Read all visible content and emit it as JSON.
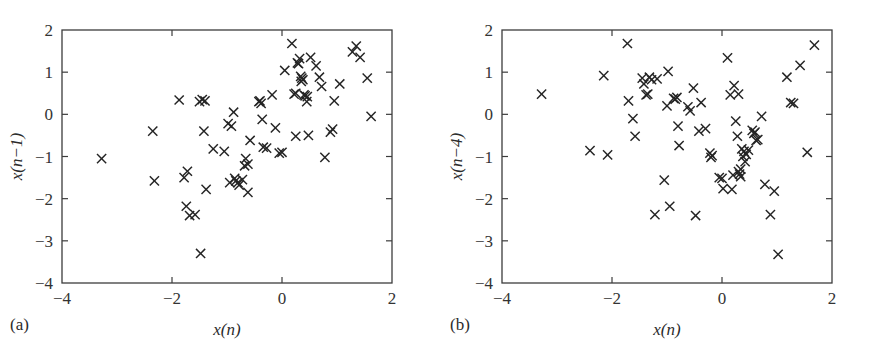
{
  "figure": {
    "background_color": "#ffffff",
    "marker_color": "#242424",
    "axis_color": "#3c3c3c",
    "marker_symbol": "x",
    "panel_count": 2
  },
  "panels": [
    {
      "caption": "(a)",
      "xlabel": "x(n)",
      "ylabel": "x(n−1)"
    },
    {
      "caption": "(b)",
      "xlabel": "x(n)",
      "ylabel": "x(n−4)"
    }
  ],
  "chart_data": [
    {
      "type": "scatter",
      "title": "",
      "panel": "(a)",
      "xlabel": "x(n)",
      "ylabel": "x(n-1)",
      "xlim": [
        -4,
        2
      ],
      "ylim": [
        -4,
        2
      ],
      "xticks": [
        -4,
        -2,
        0,
        2
      ],
      "yticks": [
        -4,
        -3,
        -2,
        -1,
        0,
        1,
        2
      ],
      "xtick_labels": [
        "-4",
        "-2",
        "0",
        "2"
      ],
      "ytick_labels": [
        "-4",
        "-3",
        "-2",
        "-1",
        "0",
        "1",
        "2"
      ],
      "grid": false,
      "legend": false,
      "marker": "x",
      "n_points": 72,
      "points": [
        [
          -3.28,
          -1.05
        ],
        [
          -2.35,
          -0.4
        ],
        [
          -2.32,
          -1.58
        ],
        [
          -1.87,
          0.34
        ],
        [
          -1.78,
          -1.5
        ],
        [
          -1.72,
          -1.35
        ],
        [
          -1.74,
          -2.18
        ],
        [
          -1.68,
          -2.4
        ],
        [
          -1.58,
          -2.38
        ],
        [
          -1.48,
          -3.3
        ],
        [
          -1.45,
          0.35
        ],
        [
          -1.4,
          0.32
        ],
        [
          -1.42,
          -0.4
        ],
        [
          -1.38,
          -1.78
        ],
        [
          -1.25,
          -0.82
        ],
        [
          -1.05,
          -0.88
        ],
        [
          -0.98,
          -0.22
        ],
        [
          -0.92,
          -0.28
        ],
        [
          -0.88,
          0.05
        ],
        [
          -0.86,
          -1.52
        ],
        [
          -0.84,
          -1.58
        ],
        [
          -0.8,
          -1.62
        ],
        [
          -0.78,
          -1.68
        ],
        [
          -0.72,
          -1.55
        ],
        [
          -0.68,
          -1.22
        ],
        [
          -0.66,
          -1.05
        ],
        [
          -0.62,
          -1.85
        ],
        [
          -0.58,
          -0.62
        ],
        [
          -0.42,
          0.3
        ],
        [
          -0.38,
          0.26
        ],
        [
          -0.36,
          -0.12
        ],
        [
          -0.34,
          -0.78
        ],
        [
          -0.28,
          -0.8
        ],
        [
          -0.18,
          0.46
        ],
        [
          -0.12,
          -0.32
        ],
        [
          -0.05,
          -0.92
        ],
        [
          0.0,
          -0.9
        ],
        [
          0.05,
          1.04
        ],
        [
          0.18,
          1.68
        ],
        [
          0.22,
          0.48
        ],
        [
          0.25,
          -0.52
        ],
        [
          0.28,
          1.22
        ],
        [
          0.32,
          1.32
        ],
        [
          0.35,
          0.78
        ],
        [
          0.38,
          0.82
        ],
        [
          0.4,
          0.46
        ],
        [
          0.42,
          0.44
        ],
        [
          0.45,
          0.3
        ],
        [
          0.48,
          -0.5
        ],
        [
          0.52,
          1.35
        ],
        [
          0.62,
          1.15
        ],
        [
          0.68,
          0.88
        ],
        [
          0.72,
          0.66
        ],
        [
          0.78,
          -1.02
        ],
        [
          0.88,
          -0.42
        ],
        [
          0.92,
          -0.35
        ],
        [
          0.95,
          0.32
        ],
        [
          1.05,
          0.72
        ],
        [
          1.28,
          1.48
        ],
        [
          1.35,
          1.62
        ],
        [
          1.42,
          1.35
        ],
        [
          1.55,
          0.86
        ],
        [
          1.62,
          -0.05
        ],
        [
          -0.95,
          -1.62
        ],
        [
          0.36,
          0.86
        ],
        [
          0.34,
          0.9
        ],
        [
          -0.4,
          0.32
        ],
        [
          -1.5,
          0.3
        ],
        [
          0.3,
          1.2
        ],
        [
          0.46,
          0.42
        ],
        [
          0.25,
          0.5
        ],
        [
          -0.62,
          -1.18
        ]
      ]
    },
    {
      "type": "scatter",
      "title": "",
      "panel": "(b)",
      "xlabel": "x(n)",
      "ylabel": "x(n-4)",
      "xlim": [
        -4,
        2
      ],
      "ylim": [
        -4,
        2
      ],
      "xticks": [
        -4,
        -2,
        0,
        2
      ],
      "yticks": [
        -4,
        -3,
        -2,
        -1,
        0,
        1,
        2
      ],
      "xtick_labels": [
        "-4",
        "-2",
        "0",
        "2"
      ],
      "ytick_labels": [
        "-4",
        "-3",
        "-2",
        "-1",
        "0",
        "1",
        "2"
      ],
      "grid": false,
      "legend": false,
      "marker": "x",
      "n_points": 72,
      "points": [
        [
          -3.28,
          0.48
        ],
        [
          -2.4,
          -0.86
        ],
        [
          -2.15,
          0.92
        ],
        [
          -2.08,
          -0.96
        ],
        [
          -1.72,
          1.68
        ],
        [
          -1.7,
          0.32
        ],
        [
          -1.62,
          -0.1
        ],
        [
          -1.58,
          -0.52
        ],
        [
          -1.45,
          0.86
        ],
        [
          -1.42,
          0.72
        ],
        [
          -1.38,
          0.46
        ],
        [
          -1.32,
          0.88
        ],
        [
          -1.28,
          0.82
        ],
        [
          -1.22,
          -2.38
        ],
        [
          -1.05,
          -1.56
        ],
        [
          -0.98,
          1.02
        ],
        [
          -1.0,
          0.2
        ],
        [
          -0.95,
          -2.18
        ],
        [
          -0.88,
          0.38
        ],
        [
          -0.82,
          0.4
        ],
        [
          -0.8,
          -0.28
        ],
        [
          -0.78,
          -0.74
        ],
        [
          -0.62,
          0.18
        ],
        [
          -0.58,
          0.08
        ],
        [
          -0.52,
          0.62
        ],
        [
          -0.48,
          -2.4
        ],
        [
          -0.42,
          -0.4
        ],
        [
          -0.38,
          0.28
        ],
        [
          -0.3,
          -0.34
        ],
        [
          -0.22,
          -0.92
        ],
        [
          -0.2,
          -1.02
        ],
        [
          -0.05,
          -1.5
        ],
        [
          0.0,
          -1.52
        ],
        [
          0.02,
          -1.76
        ],
        [
          0.1,
          1.34
        ],
        [
          0.15,
          0.46
        ],
        [
          0.18,
          -1.78
        ],
        [
          0.22,
          0.68
        ],
        [
          0.25,
          -0.16
        ],
        [
          0.28,
          -0.52
        ],
        [
          0.3,
          -1.36
        ],
        [
          0.32,
          -1.42
        ],
        [
          0.34,
          -1.3
        ],
        [
          0.36,
          -0.82
        ],
        [
          0.38,
          -1.0
        ],
        [
          0.42,
          -1.12
        ],
        [
          0.48,
          -0.85
        ],
        [
          0.55,
          -0.38
        ],
        [
          0.6,
          -0.42
        ],
        [
          0.65,
          -0.6
        ],
        [
          0.72,
          -0.05
        ],
        [
          0.78,
          -1.66
        ],
        [
          0.88,
          -2.38
        ],
        [
          0.95,
          -1.82
        ],
        [
          1.02,
          -3.32
        ],
        [
          1.18,
          0.88
        ],
        [
          1.25,
          0.28
        ],
        [
          1.3,
          0.26
        ],
        [
          1.42,
          1.16
        ],
        [
          1.55,
          -0.9
        ],
        [
          1.68,
          1.64
        ],
        [
          -1.18,
          0.84
        ],
        [
          -0.85,
          0.36
        ],
        [
          0.34,
          -1.48
        ],
        [
          0.4,
          -0.88
        ],
        [
          0.44,
          -0.95
        ],
        [
          0.58,
          -0.45
        ],
        [
          0.2,
          -1.44
        ],
        [
          -0.18,
          -0.98
        ],
        [
          -1.35,
          0.48
        ],
        [
          0.62,
          -0.62
        ],
        [
          0.3,
          0.48
        ]
      ]
    }
  ]
}
